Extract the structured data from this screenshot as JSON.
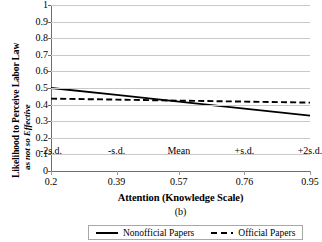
{
  "chart_data": {
    "type": "line",
    "title": "",
    "caption": "(b)",
    "xlabel": "Attention (Knowledge Scale)",
    "ylabel_line1": "Likelihood to Perceive Labor Law",
    "ylabel_line2_prefix": "as ",
    "ylabel_line2_italic": "not so Effective",
    "x": [
      0.2,
      0.39,
      0.57,
      0.76,
      0.95
    ],
    "categories": [
      "0.2",
      "0.39",
      "0.57",
      "0.76",
      "0.95"
    ],
    "category_labels_top": [
      "-2s.d.",
      "-s.d.",
      "Mean",
      "+s.d.",
      "+2s.d."
    ],
    "ylim": [
      0,
      1
    ],
    "xlim": [
      0.2,
      0.95
    ],
    "yticks": [
      "1",
      "0.9",
      "0.8",
      "0.7",
      "0.6",
      "0.5",
      "0.4",
      "0.3",
      "0.2",
      "0.1",
      "0"
    ],
    "ytick_values": [
      1,
      0.9,
      0.8,
      0.7,
      0.6,
      0.5,
      0.4,
      0.3,
      0.2,
      0.1,
      0
    ],
    "grid": true,
    "legend_position": "bottom",
    "series": [
      {
        "name": "Nonofficial Papers",
        "style": "solid",
        "color": "#000000",
        "values": [
          0.5,
          0.458,
          0.418,
          0.376,
          0.333
        ]
      },
      {
        "name": "Official Papers",
        "style": "dashed",
        "color": "#000000",
        "values": [
          0.436,
          0.43,
          0.424,
          0.418,
          0.412
        ]
      }
    ]
  },
  "legend": {
    "items": [
      {
        "label": "Nonofficial Papers",
        "style": "solid"
      },
      {
        "label": "Official Papers",
        "style": "dashed"
      }
    ]
  }
}
